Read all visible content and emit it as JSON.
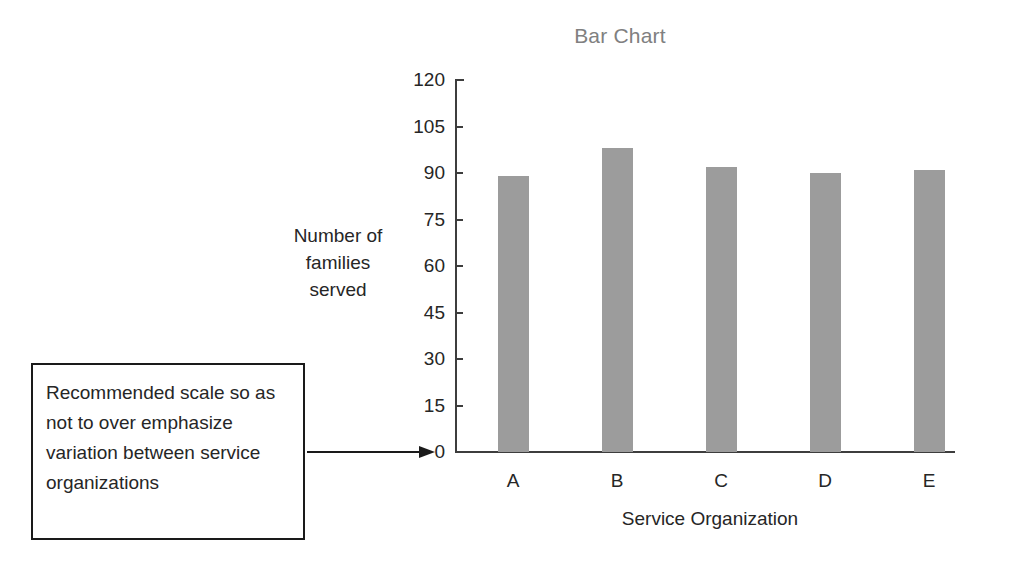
{
  "chart_data": {
    "type": "bar",
    "title": "Bar Chart",
    "xlabel": "Service Organization",
    "ylabel": "Number of families served",
    "ylabel_lines": [
      "Number of",
      "families",
      "served"
    ],
    "categories": [
      "A",
      "B",
      "C",
      "D",
      "E"
    ],
    "values": [
      89,
      98,
      92,
      90,
      91
    ],
    "yticks": [
      120,
      105,
      90,
      75,
      60,
      45,
      30,
      15,
      0
    ],
    "ylim": [
      0,
      120
    ],
    "grid": false,
    "legend": false,
    "bar_color": "#9c9c9c",
    "axis_color": "#3d3d3d",
    "title_color": "#808080",
    "text_color": "#262626"
  },
  "annotation": {
    "text": "Recommended scale so as not to over emphasize variation between service organizations",
    "border_color": "#1a1a1a",
    "arrow_target": "y-axis-zero"
  }
}
